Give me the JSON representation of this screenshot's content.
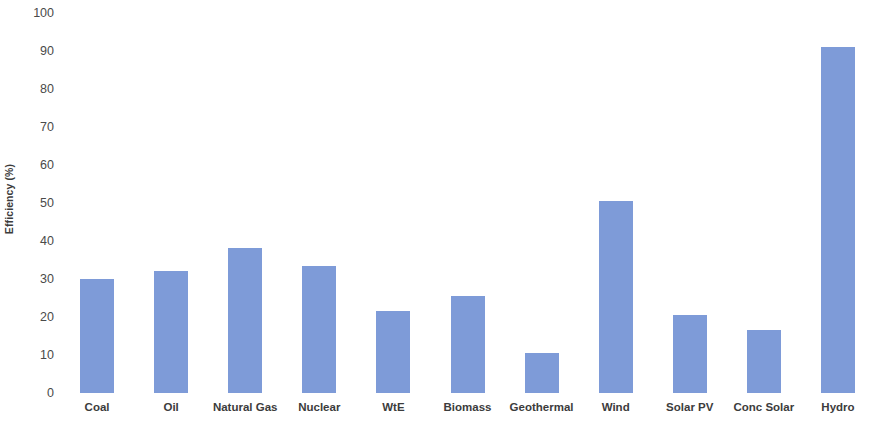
{
  "chart_data": {
    "type": "bar",
    "title": "",
    "subtitle": "",
    "xlabel": "",
    "ylabel": "Efficiency (%)",
    "ylim": [
      0,
      100
    ],
    "ytick_labels": [
      "100",
      "90",
      "80",
      "70",
      "60",
      "50",
      "40",
      "30",
      "20",
      "10",
      "0"
    ],
    "ytick_values": [
      100,
      90,
      80,
      70,
      60,
      50,
      40,
      30,
      20,
      10,
      0
    ],
    "grid": false,
    "legend": false,
    "legend_position": "none",
    "bar_color": "#7e9bd8",
    "background_color": "#ffffff",
    "categories": [
      "Coal",
      "Oil",
      "Natural Gas",
      "Nuclear",
      "WtE",
      "Biomass",
      "Geothermal",
      "Wind",
      "Solar PV",
      "Conc Solar",
      "Hydro"
    ],
    "values": [
      30,
      32,
      38,
      33.5,
      21.5,
      25.5,
      10.5,
      50.5,
      20.5,
      16.5,
      91
    ],
    "series": [
      {
        "name": "Efficiency (%)",
        "values": [
          30,
          32,
          38,
          33.5,
          21.5,
          25.5,
          10.5,
          50.5,
          20.5,
          16.5,
          91
        ]
      }
    ],
    "annotations": []
  }
}
